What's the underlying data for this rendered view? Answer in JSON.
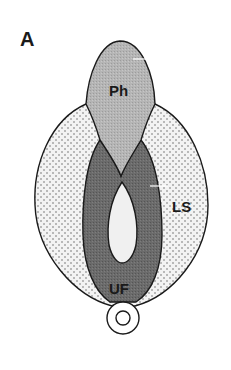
{
  "figure": {
    "panel_label": "A",
    "regions": [
      {
        "id": "Ph",
        "label": "Ph",
        "fill": "#b4b4b4",
        "pattern": "fine-grain"
      },
      {
        "id": "LS",
        "label": "LS",
        "fill": "#f2f2f2",
        "pattern": "dots"
      },
      {
        "id": "UF",
        "label": "UF",
        "fill": "#6a6a6a",
        "pattern": "fine-grain"
      }
    ],
    "lumen_fill": "#f0f0f0",
    "outline_color": "#1a1a1a",
    "bottom_ring": {
      "outer_fill": "#ffffff",
      "inner_fill": "#ffffff"
    }
  }
}
